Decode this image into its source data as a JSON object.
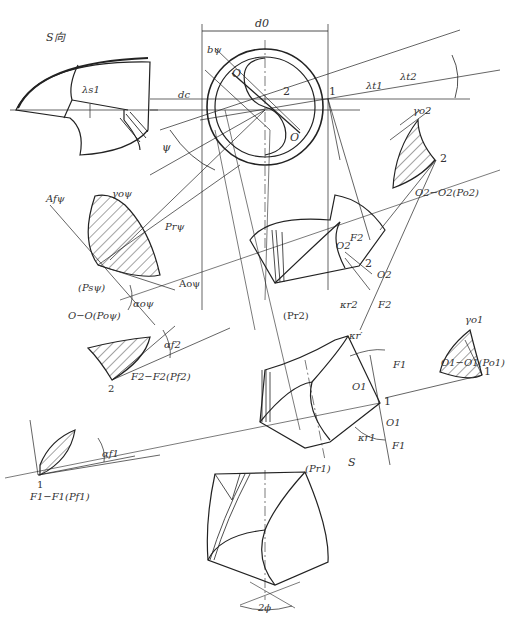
{
  "diagram": {
    "colors": {
      "line": "#222222",
      "thin": "#555555",
      "text": "#333333",
      "background": "#ffffff"
    }
  },
  "labels": {
    "s_view": "S向",
    "lambda_s1": "λs1",
    "d0": "d0",
    "b_psi": "bψ",
    "dc": "dc",
    "O_top": "O",
    "O_bottom": "O",
    "point_2_top": "2",
    "point_1_top": "1",
    "lambda_t1": "λt1",
    "lambda_t2": "λt2",
    "psi": "ψ",
    "gamma_o2": "γo2",
    "point_2_right": "2",
    "o2_section": "O2−O2(Po2)",
    "A_f_psi": "Afψ",
    "gamma_o_psi": "γoψ",
    "P_r_psi": "Prψ",
    "P_s_psi": "(Psψ)",
    "A_o_psi": "Aoψ",
    "alpha_o_psi": "αoψ",
    "o_section": "O−O(Poψ)",
    "O2_a": "O2",
    "F2_a": "F2",
    "point_2_mid": "2",
    "O2_b": "O2",
    "kappa_r2": "κr2",
    "F2_b": "F2",
    "P_r2": "(Pr2)",
    "alpha_f2": "αf2",
    "point_2_lower": "2",
    "f2_section": "F2−F2(Pf2)",
    "gamma_o1": "γo1",
    "point_1_right": "1",
    "o1_section": "O1−O1(Po1)",
    "kappa_r_prime": "κr′",
    "F1_a": "F1",
    "O1_a": "O1",
    "point_1_mid": "1",
    "O1_b": "O1",
    "kappa_r1": "κr1",
    "F1_b": "F1",
    "S": "S",
    "alpha_f1": "αf1",
    "point_1_left": "1",
    "f1_section": "F1−F1(Pf1)",
    "P_r1": "(Pr1)",
    "two_phi": "2ϕ"
  }
}
